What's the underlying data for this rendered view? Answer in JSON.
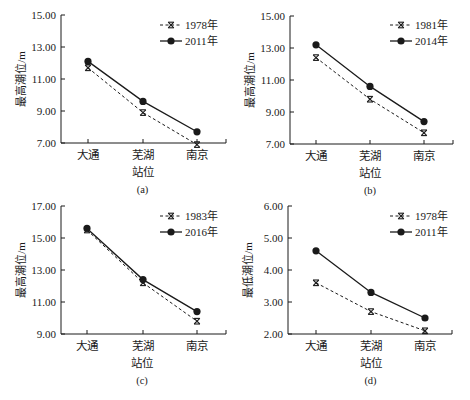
{
  "chart_data": [
    {
      "id": "a",
      "type": "line",
      "title": "",
      "caption": "(a)",
      "xlabel": "站位",
      "ylabel": "最高潮位/m",
      "categories": [
        "大通",
        "芜湖",
        "南京"
      ],
      "ylim": [
        7.0,
        15.0
      ],
      "yticks": [
        "7.00",
        "9.00",
        "11.00",
        "13.00",
        "15.00"
      ],
      "legend_position": "upper right",
      "grid": false,
      "series": [
        {
          "name": "1978年",
          "style": "dashed",
          "marker": "asterisk",
          "values": [
            11.7,
            8.9,
            6.9
          ]
        },
        {
          "name": "2011年",
          "style": "solid",
          "marker": "circle",
          "values": [
            12.1,
            9.6,
            7.7
          ]
        }
      ]
    },
    {
      "id": "b",
      "type": "line",
      "title": "",
      "caption": "(b)",
      "xlabel": "站位",
      "ylabel": "最高潮位/m",
      "categories": [
        "大通",
        "芜湖",
        "南京"
      ],
      "ylim": [
        7.0,
        15.0
      ],
      "yticks": [
        "7.00",
        "9.00",
        "11.00",
        "13.00",
        "15.00"
      ],
      "legend_position": "upper right",
      "grid": false,
      "series": [
        {
          "name": "1981年",
          "style": "dashed",
          "marker": "asterisk",
          "values": [
            12.4,
            9.8,
            7.7
          ]
        },
        {
          "name": "2014年",
          "style": "solid",
          "marker": "circle",
          "values": [
            13.2,
            10.6,
            8.4
          ]
        }
      ]
    },
    {
      "id": "c",
      "type": "line",
      "title": "",
      "caption": "(c)",
      "xlabel": "站位",
      "ylabel": "最高潮位/m",
      "categories": [
        "大通",
        "芜湖",
        "南京"
      ],
      "ylim": [
        9.0,
        17.0
      ],
      "yticks": [
        "9.00",
        "11.00",
        "13.00",
        "15.00",
        "17.00"
      ],
      "legend_position": "upper right",
      "grid": false,
      "series": [
        {
          "name": "1983年",
          "style": "dashed",
          "marker": "asterisk",
          "values": [
            15.5,
            12.2,
            9.8
          ]
        },
        {
          "name": "2016年",
          "style": "solid",
          "marker": "circle",
          "values": [
            15.6,
            12.4,
            10.4
          ]
        }
      ]
    },
    {
      "id": "d",
      "type": "line",
      "title": "",
      "caption": "(d)",
      "xlabel": "站位",
      "ylabel": "最低潮位/m",
      "categories": [
        "大通",
        "芜湖",
        "南京"
      ],
      "ylim": [
        2.0,
        6.0
      ],
      "yticks": [
        "2.00",
        "3.00",
        "4.00",
        "5.00",
        "6.00"
      ],
      "legend_position": "upper right",
      "grid": false,
      "series": [
        {
          "name": "1978年",
          "style": "dashed",
          "marker": "asterisk",
          "values": [
            3.6,
            2.7,
            2.1
          ]
        },
        {
          "name": "2011年",
          "style": "solid",
          "marker": "circle",
          "values": [
            4.6,
            3.3,
            2.5
          ]
        }
      ]
    }
  ],
  "layout": {
    "panels": [
      {
        "x0": 61,
        "x1": 226,
        "ytop": 15,
        "ybot": 143,
        "xticks": [
          88,
          143,
          197
        ],
        "legend": [
          160,
          25
        ]
      },
      {
        "x0": 290,
        "x1": 453,
        "ytop": 16,
        "ybot": 144,
        "xticks": [
          316,
          370,
          424
        ],
        "legend": [
          390,
          25
        ]
      },
      {
        "x0": 61,
        "x1": 226,
        "ytop": 206,
        "ybot": 334,
        "xticks": [
          87,
          143,
          197
        ],
        "legend": [
          160,
          216
        ]
      },
      {
        "x0": 288,
        "x1": 452,
        "ytop": 206,
        "ybot": 334,
        "xticks": [
          316,
          371,
          425
        ],
        "legend": [
          390,
          216
        ]
      }
    ],
    "line_color": "#1a1a1a"
  }
}
